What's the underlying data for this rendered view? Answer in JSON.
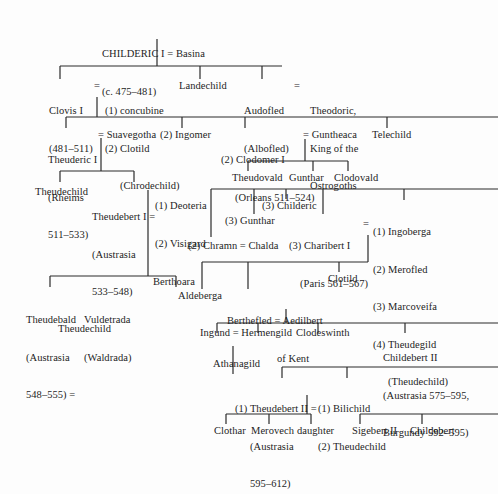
{
  "nodes": {
    "childeric": {
      "line1": "CHILDERIC I = Basina",
      "line2": "(c. 475–481)"
    },
    "clovis": {
      "line1": "Clovis I",
      "line2": "(481–511)"
    },
    "clovis_eq": "=",
    "clovis_wives": {
      "line1": "(1) concubine",
      "line2": "(2) Clotild",
      "line3": "(Chrodechild)"
    },
    "landechild": "Landechild",
    "audofled": {
      "line1": "Audofled",
      "line2": "(Albofled)"
    },
    "audofled_eq": "=",
    "theodoric": {
      "line1": "Theodoric,",
      "line2": "King of the",
      "line3": "Ostrogoths"
    },
    "theuderic": {
      "line1": "Theuderic I",
      "line2": "(Rheims",
      "line3": "511–533)"
    },
    "theuderic_eq": "= Suavegotha",
    "ingomer": "(2) Ingomer",
    "clodomer": {
      "line1": "(2) Clodomer I",
      "line2": "(Orleans 511–524)"
    },
    "guntheaca": "= Guntheaca",
    "telechild": "Telechild",
    "theudechild_1": "Theudechild",
    "theudebert1": {
      "line1": "Theudebert I =",
      "line2": "(Austrasia",
      "line3": "533–548)"
    },
    "theudebert1_wives": {
      "line1": "(1) Deoteria",
      "line2": "(2) Visigard"
    },
    "theudovald": "Theudovald",
    "gunthar_1": "Gunthar",
    "clodovald": "Clodovald",
    "childeric_3": "(3) Childeric",
    "gunthar_3": "(3) Gunthar",
    "charibert": {
      "line1": "(3) Charibert I",
      "line2": "(Paris 561–567)"
    },
    "charibert_eq": "=",
    "charibert_wives": {
      "line1": "(1) Ingoberga",
      "line2": "(2) Merofled",
      "line3": "(3) Marcoveifa",
      "line4": "(4) Theudegild",
      "line5": "(Theudechild)"
    },
    "chramn": "(2) Chramn = Chalda",
    "theudebald": {
      "line1": "Theudebald",
      "line2": "(Austrasia",
      "line3": "548–555) ="
    },
    "vuldetrada": {
      "line1": "Vuldetrada",
      "line2": "(Waldrada)"
    },
    "berthoara": "Berthoara",
    "aldeberga": "Aldeberga",
    "berthefled": {
      "line1": "Berthefled = Aedilbert",
      "line2": "of Kent"
    },
    "clotild": "Clotild",
    "theudechild_2": "Theudechild",
    "ingund": "Ingund = Hermengild",
    "clodeswinth": "Clodeswinth",
    "childebert2": {
      "line1": "Childebert II",
      "line2": "(Austrasia 575–595,",
      "line3": "Burgundy 592–595)"
    },
    "athanagild": "Athanagild",
    "theudebert2": {
      "line1": "(1) Theudebert II =",
      "line2": "(Austrasia",
      "line3": "595–612)"
    },
    "theudebert2_wives": {
      "line1": "(1) Bilichild",
      "line2": "(2) Theudechild"
    },
    "clothar": "Clothar",
    "merovech": "Merovech",
    "daughter": "daughter",
    "sigebert2": "Sigebert II",
    "childebert": "Childebert"
  }
}
